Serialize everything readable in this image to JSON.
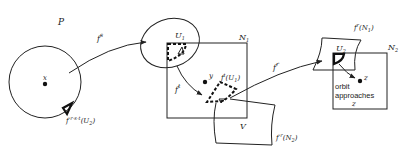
{
  "diagram": {
    "labels": {
      "P": "P",
      "x": "x",
      "f_s": "f",
      "f_s_exp": "s",
      "preimage": "f",
      "preimage_exp": "-r-s-t",
      "preimage_arg": "(U",
      "preimage_sub": "2",
      "preimage_close": ")",
      "U1": "U",
      "U1_sub": "1",
      "N1": "N",
      "N1_sub": "1",
      "y": "y",
      "f_t": "f",
      "f_t_exp": "t",
      "ftU1": "f",
      "ftU1_exp": "t",
      "ftU1_arg": "(U",
      "ftU1_sub": "1",
      "ftU1_close": ")",
      "V": "V",
      "f_r": "f",
      "f_r_exp": "r",
      "frN1": "f",
      "frN1_exp": "r",
      "frN1_arg": "(N",
      "frN1_sub": "1",
      "frN1_close": ")",
      "U2": "U",
      "U2_sub": "2",
      "N2": "N",
      "N2_sub": "2",
      "z": "z",
      "f_minus_r": "f",
      "f_minus_r_exp": "-r",
      "f_minus_r_arg": "(N",
      "f_minus_r_sub": "2",
      "f_minus_r_close": ")",
      "orbit_line1": "orbit",
      "orbit_line2": "approaches",
      "orbit_line3": "z"
    },
    "colors": {
      "stroke": "#222222",
      "background": "#ffffff"
    }
  }
}
